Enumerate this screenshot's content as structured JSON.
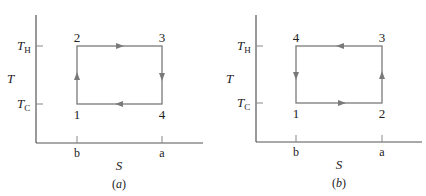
{
  "diagrams": [
    {
      "id": "a",
      "caption": "(a)",
      "caption_letter": "a",
      "y_axis_label": "T",
      "x_axis_label": "S",
      "y_ticks": [
        {
          "label": "T",
          "sub": "H"
        },
        {
          "label": "T",
          "sub": "C"
        }
      ],
      "x_ticks": [
        "b",
        "a"
      ],
      "points": {
        "p_bl": "1",
        "p_tl": "2",
        "p_tr": "3",
        "p_br": "4"
      },
      "cycle_direction": "clockwise",
      "cycle_order": [
        "1",
        "2",
        "3",
        "4"
      ]
    },
    {
      "id": "b",
      "caption": "(b)",
      "caption_letter": "b",
      "y_axis_label": "T",
      "x_axis_label": "S",
      "y_ticks": [
        {
          "label": "T",
          "sub": "H"
        },
        {
          "label": "T",
          "sub": "C"
        }
      ],
      "x_ticks": [
        "b",
        "a"
      ],
      "points": {
        "p_bl": "1",
        "p_tl": "4",
        "p_tr": "3",
        "p_br": "2"
      },
      "cycle_direction": "counterclockwise",
      "cycle_order": [
        "1",
        "2",
        "3",
        "4"
      ]
    }
  ],
  "colors": {
    "axis": "#555555",
    "cycle": "#7a7a7a",
    "text": "#222222"
  }
}
